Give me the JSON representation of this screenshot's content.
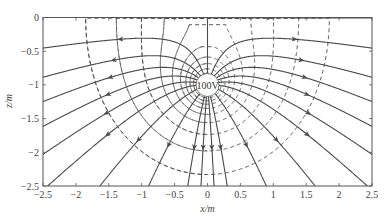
{
  "chart_data": {
    "type": "line",
    "title": "",
    "xlabel": "x/m",
    "ylabel": "z/m",
    "xlim": [
      -2.5,
      2.5
    ],
    "ylim": [
      -2.5,
      0
    ],
    "xticks": [
      -2.5,
      -2,
      -1.5,
      -1,
      -0.5,
      0,
      0.5,
      1,
      1.5,
      2,
      2.5
    ],
    "xtick_labels": [
      "-2.5",
      "-2",
      "-1.5",
      "-1",
      "-0.5",
      "0",
      "0.5",
      "1",
      "1.5",
      "2",
      "2.5"
    ],
    "yticks": [
      0,
      -0.5,
      -1,
      -1.5,
      -2,
      -2.5
    ],
    "ytick_labels": [
      "0",
      "-0.5",
      "-1",
      "-1.5",
      "-2",
      "-2.5"
    ],
    "grid": false,
    "legend": null,
    "charge": {
      "x": 0,
      "z": -1,
      "label": "100V",
      "radius_m": 0.17
    },
    "image_charge": {
      "x": 0,
      "z": 1,
      "note": "same sign (surface z=0 is a field-parallel boundary)"
    },
    "series": [
      {
        "name": "electric field lines",
        "style": "solid",
        "arrows": true,
        "count": 18,
        "start_angles_deg": [
          90,
          70,
          52,
          38,
          25,
          12,
          -2,
          -22,
          -48,
          -75,
          -85,
          -95,
          -105,
          -132,
          -158,
          -178,
          168,
          155,
          142,
          128,
          110
        ]
      },
      {
        "name": "equipotential lines",
        "style": "dashed",
        "levels_rel": [
          0.42,
          0.55,
          0.68,
          0.82,
          1.0,
          1.25,
          1.6,
          2.1,
          2.8,
          3.8
        ]
      }
    ]
  },
  "axes": {
    "x_axis_label": "x/m",
    "y_axis_label": "z/m",
    "charge_label": "100V"
  },
  "colors": {
    "line": "#4a4a4a",
    "dash": "#4a4a4a",
    "axis": "#555555",
    "background": "#ffffff"
  }
}
